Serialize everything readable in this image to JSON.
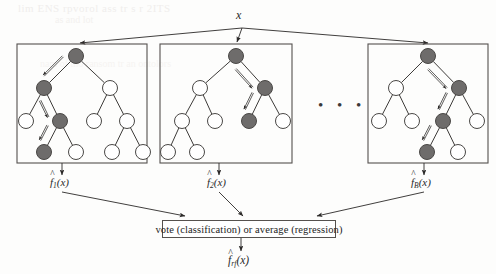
{
  "figure": {
    "title_label": "x",
    "ellipsis": "• • •",
    "bleed_text_1": "lim ENS rpvorol ass tr s r 2ITS",
    "bleed_text_2": "as and lot",
    "bleed_text_3": "nam of tho ransom tr an ontolors",
    "vote_box_label": "vote (classification) or average (regression)",
    "colors": {
      "node_filled": "#6e6c6b",
      "node_open": "#ffffff",
      "node_stroke": "#4a4846",
      "edge": "#3d3b39",
      "box_stroke": "#55514e",
      "arrow": "#2b2928",
      "text": "#232323",
      "background": "#fdfdfc"
    }
  },
  "outputs": {
    "tree1": {
      "f": "f",
      "sub": "1",
      "arg": "(x)"
    },
    "tree2": {
      "f": "f",
      "sub": "2",
      "arg": "(x)"
    },
    "tree3": {
      "f": "f",
      "sub": "B",
      "arg": "(x)"
    },
    "final": {
      "f": "f",
      "sub": "rf",
      "arg": "(x)"
    }
  },
  "trees": [
    {
      "name": "tree-1",
      "box": {
        "x": 17,
        "y": 44,
        "w": 130,
        "h": 119
      },
      "nodes": [
        {
          "id": "n0",
          "x": 76,
          "y": 56,
          "r": 7.5,
          "filled": true
        },
        {
          "id": "n1",
          "x": 44,
          "y": 88,
          "r": 7.5,
          "filled": true
        },
        {
          "id": "n2",
          "x": 110,
          "y": 88,
          "r": 7.5,
          "filled": false
        },
        {
          "id": "n3",
          "x": 26,
          "y": 121,
          "r": 7.5,
          "filled": false
        },
        {
          "id": "n4",
          "x": 60,
          "y": 121,
          "r": 7.5,
          "filled": true
        },
        {
          "id": "n5",
          "x": 94,
          "y": 121,
          "r": 7.5,
          "filled": false
        },
        {
          "id": "n6",
          "x": 127,
          "y": 121,
          "r": 7.5,
          "filled": false
        },
        {
          "id": "n7",
          "x": 44,
          "y": 152,
          "r": 7.5,
          "filled": true
        },
        {
          "id": "n8",
          "x": 76,
          "y": 152,
          "r": 7.5,
          "filled": false
        },
        {
          "id": "n9",
          "x": 112,
          "y": 152,
          "r": 7.5,
          "filled": false
        },
        {
          "id": "n10",
          "x": 143,
          "y": 152,
          "r": 7.5,
          "filled": false
        }
      ],
      "edges": [
        [
          "n0",
          "n1"
        ],
        [
          "n0",
          "n2"
        ],
        [
          "n1",
          "n3"
        ],
        [
          "n1",
          "n4"
        ],
        [
          "n2",
          "n5"
        ],
        [
          "n2",
          "n6"
        ],
        [
          "n4",
          "n7"
        ],
        [
          "n4",
          "n8"
        ],
        [
          "n6",
          "n9"
        ],
        [
          "n6",
          "n10"
        ]
      ],
      "path_arrows": [
        {
          "from": "n0",
          "to": "n1"
        },
        {
          "from": "n1",
          "to": "n4"
        },
        {
          "from": "n4",
          "to": "n7"
        }
      ]
    },
    {
      "name": "tree-2",
      "box": {
        "x": 160,
        "y": 44,
        "w": 132,
        "h": 119
      },
      "nodes": [
        {
          "id": "m0",
          "x": 236,
          "y": 56,
          "r": 7.5,
          "filled": true
        },
        {
          "id": "m1",
          "x": 200,
          "y": 88,
          "r": 7.5,
          "filled": false
        },
        {
          "id": "m2",
          "x": 265,
          "y": 88,
          "r": 7.5,
          "filled": true
        },
        {
          "id": "m3",
          "x": 182,
          "y": 121,
          "r": 7.5,
          "filled": false
        },
        {
          "id": "m4",
          "x": 215,
          "y": 121,
          "r": 7.5,
          "filled": false
        },
        {
          "id": "m5",
          "x": 249,
          "y": 121,
          "r": 7.5,
          "filled": true
        },
        {
          "id": "m6",
          "x": 283,
          "y": 121,
          "r": 7.5,
          "filled": false
        },
        {
          "id": "m7",
          "x": 168,
          "y": 152,
          "r": 7.5,
          "filled": false
        },
        {
          "id": "m8",
          "x": 197,
          "y": 152,
          "r": 7.5,
          "filled": false
        }
      ],
      "edges": [
        [
          "m0",
          "m1"
        ],
        [
          "m0",
          "m2"
        ],
        [
          "m1",
          "m3"
        ],
        [
          "m1",
          "m4"
        ],
        [
          "m2",
          "m5"
        ],
        [
          "m2",
          "m6"
        ],
        [
          "m3",
          "m7"
        ],
        [
          "m3",
          "m8"
        ]
      ],
      "path_arrows": [
        {
          "from": "m0",
          "to": "m2"
        },
        {
          "from": "m2",
          "to": "m5"
        }
      ]
    },
    {
      "name": "tree-3",
      "box": {
        "x": 368,
        "y": 44,
        "w": 120,
        "h": 119
      },
      "nodes": [
        {
          "id": "p0",
          "x": 428,
          "y": 56,
          "r": 7.5,
          "filled": true
        },
        {
          "id": "p1",
          "x": 396,
          "y": 88,
          "r": 7.5,
          "filled": false
        },
        {
          "id": "p2",
          "x": 459,
          "y": 88,
          "r": 7.5,
          "filled": true
        },
        {
          "id": "p3",
          "x": 379,
          "y": 121,
          "r": 7.5,
          "filled": false
        },
        {
          "id": "p4",
          "x": 412,
          "y": 121,
          "r": 7.5,
          "filled": false
        },
        {
          "id": "p5",
          "x": 443,
          "y": 121,
          "r": 7.5,
          "filled": true
        },
        {
          "id": "p6",
          "x": 477,
          "y": 121,
          "r": 7.5,
          "filled": false
        },
        {
          "id": "p7",
          "x": 427,
          "y": 152,
          "r": 7.5,
          "filled": true
        },
        {
          "id": "p8",
          "x": 458,
          "y": 152,
          "r": 7.5,
          "filled": false
        }
      ],
      "edges": [
        [
          "p0",
          "p1"
        ],
        [
          "p0",
          "p2"
        ],
        [
          "p1",
          "p3"
        ],
        [
          "p1",
          "p4"
        ],
        [
          "p2",
          "p5"
        ],
        [
          "p2",
          "p6"
        ],
        [
          "p5",
          "p7"
        ],
        [
          "p5",
          "p8"
        ]
      ],
      "path_arrows": [
        {
          "from": "p0",
          "to": "p2"
        },
        {
          "from": "p2",
          "to": "p5"
        },
        {
          "from": "p5",
          "to": "p7"
        }
      ]
    }
  ],
  "vote_box": {
    "x": 162,
    "y": 220,
    "w": 174,
    "h": 18
  },
  "root_x_point": {
    "x": 242,
    "y": 28
  },
  "fan_targets": [
    {
      "x": 80,
      "y": 43
    },
    {
      "x": 237,
      "y": 42
    },
    {
      "x": 428,
      "y": 43
    }
  ],
  "merge_arrows": [
    {
      "x1": 62,
      "y1": 192,
      "x2": 185,
      "y2": 216
    },
    {
      "x1": 219,
      "y1": 192,
      "x2": 243,
      "y2": 216
    },
    {
      "x1": 424,
      "y1": 192,
      "x2": 317,
      "y2": 216
    }
  ]
}
